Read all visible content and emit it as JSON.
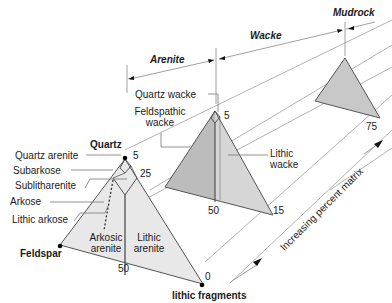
{
  "diagram": {
    "title_classes": {
      "arenite": "Arenite",
      "wacke": "Wacke",
      "mudrock": "Mudrock"
    },
    "vertices": {
      "quartz": "Quartz",
      "feldspar": "Feldspar",
      "lithic": "lithic fragments"
    },
    "arenite_fields": {
      "quartz_arenite": "Quartz arenite",
      "subarkose": "Subarkose",
      "sublitharenite": "Sublitharenite",
      "arkose": "Arkose",
      "lithic_arkose": "Lithic arkose",
      "arkosic_arenite_1": "Arkosic",
      "arkosic_arenite_2": "arenite",
      "lithic_arenite_1": "Lithic",
      "lithic_arenite_2": "arenite"
    },
    "wacke_fields": {
      "quartz_wacke": "Quartz wacke",
      "feldspathic_wacke_1": "Feldspathic",
      "feldspathic_wacke_2": "wacke",
      "lithic_wacke_1": "Lithic",
      "lithic_wacke_2": "wacke"
    },
    "ticks": {
      "arenite_q5": "5",
      "arenite_q25": "25",
      "arenite_50": "50",
      "matrix_0": "0",
      "wacke_q5": "5",
      "wacke_50": "50",
      "matrix_15": "15",
      "matrix_75": "75"
    },
    "axis_label": "Increasing percent matrix",
    "colors": {
      "arenite_fill": "#e6e6e6",
      "wacke_fill_left": "#bdbdbd",
      "wacke_fill_right": "#d4d4d4",
      "mudrock_fill": "#c4c4c4",
      "line": "#555555",
      "guide": "#9a9a9a"
    }
  }
}
